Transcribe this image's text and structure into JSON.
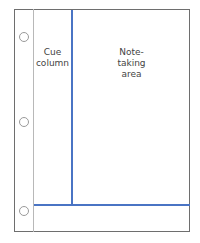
{
  "diagram": {
    "regions": {
      "cue_column": {
        "line1": "Cue",
        "line2": "column"
      },
      "note_area": {
        "line1": "Note-",
        "line2": "taking",
        "line3": "area"
      },
      "summary_area": {
        "label": ""
      }
    },
    "binder_holes": 3,
    "colors": {
      "divider": "#4a74c4",
      "border": "#6e6e6e",
      "margin": "#b8b8b8",
      "text": "#444444"
    }
  }
}
